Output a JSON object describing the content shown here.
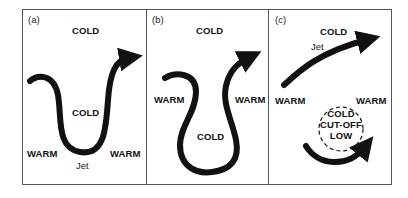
{
  "figure": {
    "panels": [
      {
        "id": "a",
        "label": "(a)",
        "cold_top": "COLD",
        "cold_inner": "COLD",
        "warm_left": "WARM",
        "warm_right": "WARM",
        "jet": "Jet"
      },
      {
        "id": "b",
        "label": "(b)",
        "cold_top": "COLD",
        "cold_inner": "COLD",
        "warm_left": "WARM",
        "warm_right": "WARM"
      },
      {
        "id": "c",
        "label": "(c)",
        "cold_top": "COLD",
        "jet": "Jet",
        "warm_left": "WARM",
        "warm_right": "WARM",
        "cutoff_line1": "COLD",
        "cutoff_line2": "CUT-OFF",
        "cutoff_line3": "LOW"
      }
    ],
    "colors": {
      "stroke": "#111111",
      "frame": "#555555",
      "background": "#ffffff"
    }
  }
}
